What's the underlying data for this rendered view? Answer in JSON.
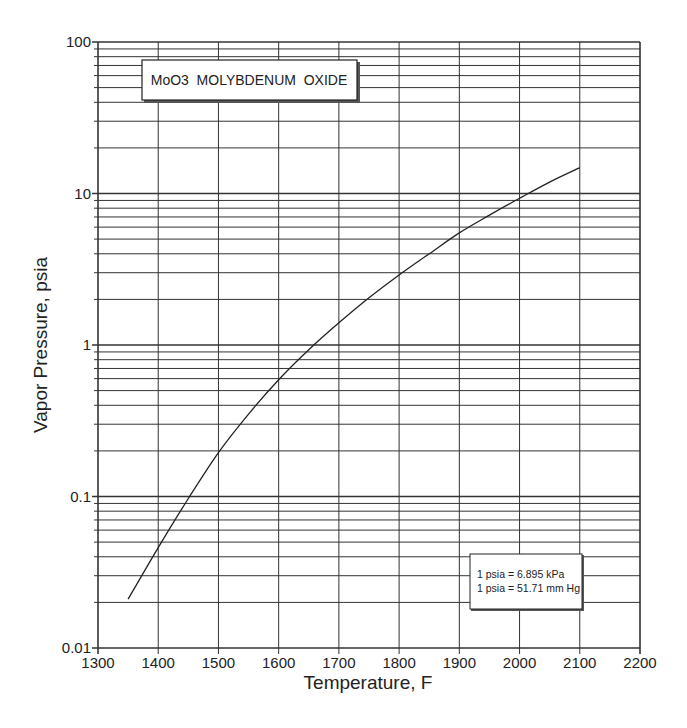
{
  "chart_data": {
    "type": "line",
    "title": "MoO3  MOLYBDENUM  OXIDE",
    "xlabel": "Temperature, F",
    "ylabel": "Vapor Pressure, psia",
    "xlim": [
      1300,
      2200
    ],
    "ylim": [
      0.01,
      100
    ],
    "yscale": "log",
    "grid": true,
    "x_ticks": [
      1300,
      1400,
      1500,
      1600,
      1700,
      1800,
      1900,
      2000,
      2100,
      2200
    ],
    "x_tick_labels": [
      "1300",
      "1400",
      "1500",
      "1600",
      "1700",
      "1800",
      "1900",
      "2000",
      "2100",
      "2200"
    ],
    "y_ticks": [
      0.01,
      0.1,
      1,
      10,
      100
    ],
    "y_tick_labels": [
      "0.01",
      "0.1",
      "1",
      "10",
      "100"
    ],
    "series": [
      {
        "name": "MoO3 vapor pressure",
        "x": [
          1350,
          1400,
          1450,
          1500,
          1550,
          1600,
          1650,
          1700,
          1750,
          1800,
          1850,
          1900,
          1950,
          2000,
          2050,
          2100
        ],
        "y": [
          0.021,
          0.046,
          0.097,
          0.195,
          0.35,
          0.59,
          0.93,
          1.4,
          2.05,
          2.9,
          4.0,
          5.5,
          7.2,
          9.3,
          11.9,
          14.8
        ]
      }
    ],
    "annotations": [
      "1 psia = 6.895 kPa",
      "1 psia = 51.71 mm Hg"
    ],
    "legend_position": "lower right (conversion note box)"
  },
  "title_box": {
    "text": "MoO3  MOLYBDENUM  OXIDE"
  },
  "note_box": {
    "line1": "1 psia = 6.895 kPa",
    "line2": "1 psia = 51.71 mm Hg"
  },
  "axes": {
    "x_title": "Temperature, F",
    "y_title": "Vapor Pressure, psia"
  },
  "colors": {
    "grid": "#333333",
    "curve": "#222222",
    "background": "#ffffff"
  }
}
